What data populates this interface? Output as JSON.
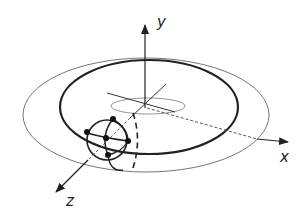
{
  "diagram": {
    "type": "3d-coordinate-orbit-diagram",
    "axes": {
      "x": {
        "label": "x"
      },
      "y": {
        "label": "y"
      },
      "z": {
        "label": "z"
      }
    },
    "elements": [
      {
        "name": "outer-orbit",
        "style": "thin ellipse"
      },
      {
        "name": "inner-orbit",
        "style": "thick ellipse"
      },
      {
        "name": "small-center-ellipse",
        "style": "thin ellipse at origin"
      },
      {
        "name": "small-sphere",
        "style": "circle with great-circle arcs and 5 node dots",
        "dots": 5
      },
      {
        "name": "dashed-vertical-arc",
        "style": "dashed arc beside sphere"
      }
    ],
    "colors": {
      "ink": "#222222",
      "thin_line": "#555555",
      "background": "#ffffff"
    }
  }
}
